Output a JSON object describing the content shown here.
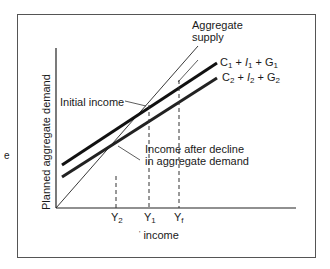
{
  "diagram": {
    "type": "keynesian-cross",
    "y_axis_label": "Planned aggregate demand",
    "x_axis_label": "income",
    "x_axis_prefix_mark": "'",
    "lines": [
      {
        "id": "aggregate-supply",
        "label_line1": "Aggregate",
        "label_line2": "supply",
        "style": "thin"
      },
      {
        "id": "ad1",
        "label": {
          "C": "C",
          "C_sub": "1",
          "plus1": "+",
          "I": "I",
          "I_sub": "1",
          "plus2": "+",
          "G": "G",
          "G_sub": "1"
        },
        "style": "thick"
      },
      {
        "id": "ad2",
        "label": {
          "C": "C",
          "C_sub": "2",
          "plus1": "+",
          "I": "I",
          "I_sub": "2",
          "plus2": "+",
          "G": "G",
          "G_sub": "2"
        },
        "style": "thick"
      }
    ],
    "annotations": {
      "initial_income": "Initial income",
      "after_decline_line1": "Income after decline",
      "after_decline_line2": "in aggregate demand"
    },
    "x_ticks": [
      {
        "base": "Y",
        "sub": "2"
      },
      {
        "base": "Y",
        "sub": "1"
      },
      {
        "base": "Y",
        "sub": "f"
      }
    ],
    "stray_mark": "e"
  }
}
